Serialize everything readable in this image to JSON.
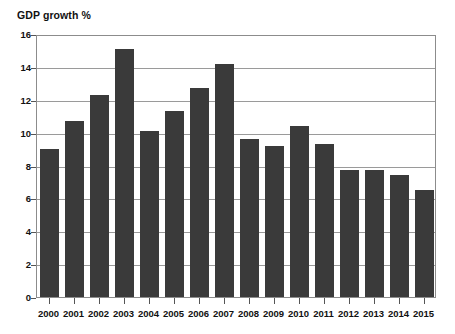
{
  "chart_data": {
    "type": "bar",
    "title": "GDP growth %",
    "xlabel": "",
    "ylabel": "",
    "ylim": [
      0,
      16
    ],
    "ytick_step": 2,
    "yticks": [
      0,
      2,
      4,
      6,
      8,
      10,
      12,
      14,
      16
    ],
    "ytick_labels": [
      "0",
      "2",
      "4",
      "6",
      "8",
      "10",
      "12",
      "14",
      "16"
    ],
    "grid": true,
    "legend": false,
    "bar_color": "#3a3a3a",
    "axis_color": "#8c8c8c",
    "categories": [
      "2000",
      "2001",
      "2002",
      "2003",
      "2004",
      "2005",
      "2006",
      "2007",
      "2008",
      "2009",
      "2010",
      "2011",
      "2012",
      "2013",
      "2014",
      "2015"
    ],
    "values": [
      9.0,
      10.7,
      12.3,
      15.1,
      10.1,
      11.3,
      12.7,
      14.2,
      9.6,
      9.2,
      10.4,
      9.3,
      7.7,
      7.7,
      7.4,
      6.5
    ]
  }
}
